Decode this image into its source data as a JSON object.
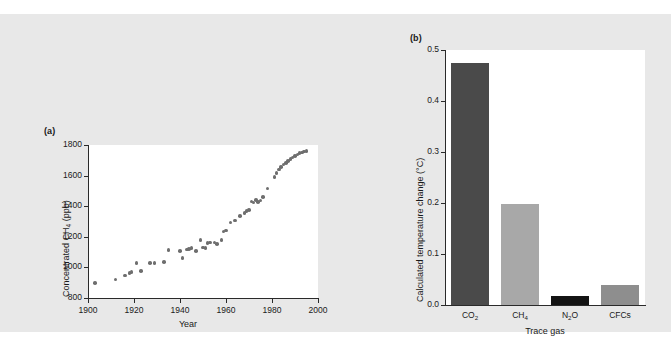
{
  "figure": {
    "background_color": "#e8e8e8",
    "panel_a_label": "(a)",
    "panel_b_label": "(b)"
  },
  "chart_data": [
    {
      "type": "scatter",
      "panel": "(a)",
      "title": "",
      "xlabel": "Year",
      "ylabel_parts": {
        "pre": "Concentrated CH",
        "sub": "4",
        "post": " (ppb)"
      },
      "ylabel": "Concentrated CH4 (ppb)",
      "xlim": [
        1900,
        2000
      ],
      "ylim": [
        800,
        1800
      ],
      "xticks": [
        1900,
        1920,
        1940,
        1960,
        1980,
        2000
      ],
      "yticks": [
        800,
        1000,
        1200,
        1400,
        1600,
        1800
      ],
      "grid": false,
      "legend": "none",
      "marker_color": "#6e6e6e",
      "x": [
        1903,
        1912,
        1916,
        1918,
        1919,
        1921,
        1923,
        1927,
        1929,
        1933,
        1935,
        1940,
        1941,
        1943,
        1944,
        1945,
        1947,
        1949,
        1950,
        1951,
        1952,
        1953,
        1955,
        1956,
        1958,
        1959,
        1960,
        1962,
        1964,
        1966,
        1968,
        1969,
        1970,
        1971,
        1972,
        1973,
        1974,
        1975,
        1976,
        1978,
        1981,
        1982,
        1983,
        1984,
        1985,
        1986,
        1987,
        1988,
        1989,
        1990,
        1991,
        1992,
        1993,
        1994,
        1995
      ],
      "y": [
        897,
        920,
        948,
        963,
        968,
        1028,
        975,
        1027,
        1029,
        1036,
        1112,
        1106,
        1063,
        1118,
        1122,
        1128,
        1108,
        1178,
        1131,
        1127,
        1160,
        1163,
        1163,
        1152,
        1179,
        1235,
        1241,
        1294,
        1307,
        1334,
        1354,
        1368,
        1374,
        1430,
        1424,
        1441,
        1429,
        1437,
        1460,
        1516,
        1589,
        1617,
        1640,
        1657,
        1672,
        1684,
        1697,
        1709,
        1718,
        1730,
        1739,
        1748,
        1752,
        1758,
        1762
      ]
    },
    {
      "type": "bar",
      "panel": "(b)",
      "title": "",
      "xlabel": "Trace gas",
      "ylabel": "Calculated temperature change (°C)",
      "categories_display": [
        {
          "pre": "CO",
          "sub": "2",
          "post": ""
        },
        {
          "pre": "CH",
          "sub": "4",
          "post": ""
        },
        {
          "pre": "N",
          "sub": "2",
          "post": "O"
        },
        {
          "pre": "CFCs",
          "sub": "",
          "post": ""
        }
      ],
      "categories": [
        "CO2",
        "CH4",
        "N2O",
        "CFCs"
      ],
      "values": [
        0.475,
        0.198,
        0.018,
        0.04
      ],
      "bar_colors": [
        "#4a4a4a",
        "#a8a8a8",
        "#141414",
        "#8e8e8e"
      ],
      "ylim": [
        0.0,
        0.5
      ],
      "yticks": [
        "0.0",
        "0.1",
        "0.2",
        "0.3",
        "0.4",
        "0.5"
      ],
      "ytick_values": [
        0.0,
        0.1,
        0.2,
        0.3,
        0.4,
        0.5
      ],
      "grid": false,
      "legend": "none"
    }
  ]
}
